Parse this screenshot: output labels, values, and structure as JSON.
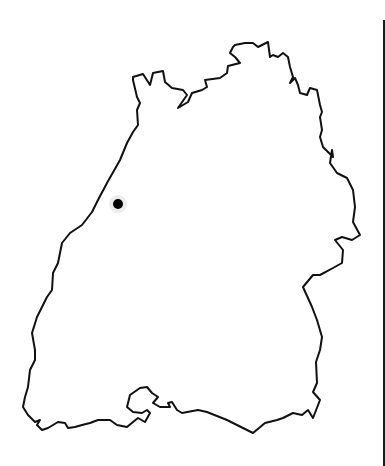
{
  "map": {
    "region": "state-outline",
    "outline_color": "#111111",
    "background_color": "#ffffff",
    "marker": {
      "x": 118,
      "y": 204,
      "radius": 5,
      "fill": "#000000",
      "halo": "#d9d9d9"
    }
  }
}
